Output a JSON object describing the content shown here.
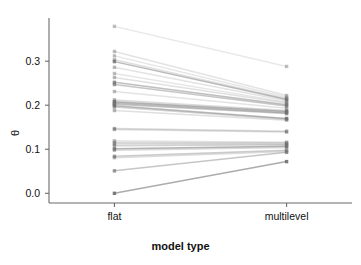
{
  "chart_data": {
    "type": "line",
    "title": "",
    "subtitle": "",
    "xlabel": "model type",
    "ylabel": "θ",
    "categories": [
      "flat",
      "multilevel"
    ],
    "x": [
      0,
      1
    ],
    "xlim": [
      -0.38,
      1.38
    ],
    "ylim": [
      -0.022,
      0.398
    ],
    "yticks": [
      0.0,
      0.1,
      0.2,
      0.3
    ],
    "ytick_labels": [
      "0.0",
      "0.1",
      "0.2",
      "0.3"
    ],
    "xticks": [
      0,
      1
    ],
    "xtick_labels": [
      "flat",
      "multilevel"
    ],
    "grid": false,
    "legend": false,
    "legend_position": "none",
    "marker": "square",
    "line_color": "#808080",
    "marker_color": "#707070",
    "axis_color": "#6b6b6b",
    "background": "#ffffff",
    "n_pairs": 30,
    "series": [
      {
        "name": "pair-01",
        "values": [
          0.379,
          0.288
        ],
        "opacity": 0.18
      },
      {
        "name": "pair-02",
        "values": [
          0.322,
          0.222
        ],
        "opacity": 0.22
      },
      {
        "name": "pair-03",
        "values": [
          0.312,
          0.218
        ],
        "opacity": 0.2
      },
      {
        "name": "pair-04",
        "values": [
          0.303,
          0.215
        ],
        "opacity": 0.26
      },
      {
        "name": "pair-05",
        "values": [
          0.299,
          0.213
        ],
        "opacity": 0.55
      },
      {
        "name": "pair-06",
        "values": [
          0.286,
          0.21
        ],
        "opacity": 0.22
      },
      {
        "name": "pair-07",
        "values": [
          0.272,
          0.207
        ],
        "opacity": 0.2
      },
      {
        "name": "pair-08",
        "values": [
          0.263,
          0.205
        ],
        "opacity": 0.24
      },
      {
        "name": "pair-09",
        "values": [
          0.252,
          0.201
        ],
        "opacity": 0.5
      },
      {
        "name": "pair-10",
        "values": [
          0.247,
          0.198
        ],
        "opacity": 0.45
      },
      {
        "name": "pair-11",
        "values": [
          0.231,
          0.193
        ],
        "opacity": 0.22
      },
      {
        "name": "pair-12",
        "values": [
          0.212,
          0.188
        ],
        "opacity": 0.3
      },
      {
        "name": "pair-13",
        "values": [
          0.208,
          0.186
        ],
        "opacity": 0.6
      },
      {
        "name": "pair-14",
        "values": [
          0.205,
          0.183
        ],
        "opacity": 0.5
      },
      {
        "name": "pair-15",
        "values": [
          0.202,
          0.181
        ],
        "opacity": 0.45
      },
      {
        "name": "pair-16",
        "values": [
          0.199,
          0.17
        ],
        "opacity": 0.55
      },
      {
        "name": "pair-17",
        "values": [
          0.196,
          0.168
        ],
        "opacity": 0.35
      },
      {
        "name": "pair-18",
        "values": [
          0.188,
          0.166
        ],
        "opacity": 0.25
      },
      {
        "name": "pair-19",
        "values": [
          0.147,
          0.141
        ],
        "opacity": 0.3
      },
      {
        "name": "pair-20",
        "values": [
          0.145,
          0.139
        ],
        "opacity": 0.28
      },
      {
        "name": "pair-21",
        "values": [
          0.119,
          0.116
        ],
        "opacity": 0.25
      },
      {
        "name": "pair-22",
        "values": [
          0.115,
          0.114
        ],
        "opacity": 0.3
      },
      {
        "name": "pair-23",
        "values": [
          0.112,
          0.112
        ],
        "opacity": 0.28
      },
      {
        "name": "pair-24",
        "values": [
          0.108,
          0.11
        ],
        "opacity": 0.35
      },
      {
        "name": "pair-25",
        "values": [
          0.101,
          0.107
        ],
        "opacity": 0.6
      },
      {
        "name": "pair-26",
        "values": [
          0.098,
          0.104
        ],
        "opacity": 0.3
      },
      {
        "name": "pair-27",
        "values": [
          0.084,
          0.098
        ],
        "opacity": 0.4
      },
      {
        "name": "pair-28",
        "values": [
          0.081,
          0.095
        ],
        "opacity": 0.28
      },
      {
        "name": "pair-29",
        "values": [
          0.051,
          0.093
        ],
        "opacity": 0.45
      },
      {
        "name": "pair-30",
        "values": [
          0.0,
          0.072
        ],
        "opacity": 0.65
      }
    ]
  }
}
